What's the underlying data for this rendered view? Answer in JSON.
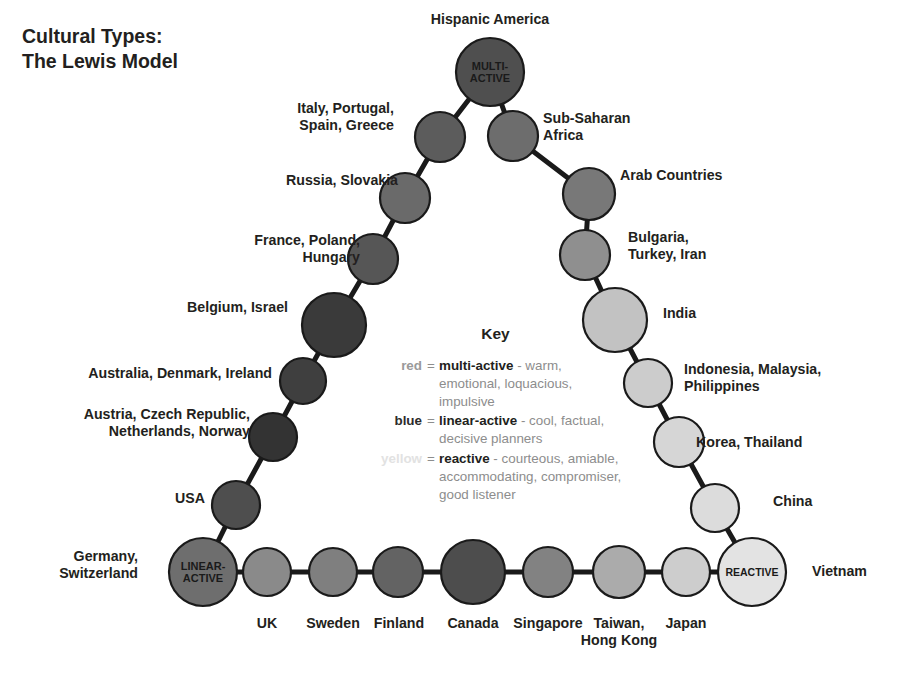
{
  "title": {
    "line1": "Cultural Types:",
    "line2": "The Lewis Model"
  },
  "key": {
    "heading": "Key",
    "rows": [
      {
        "color_word": "red",
        "color_class": "red",
        "eq": "=",
        "term": "multi-active",
        "desc": " - warm, emotional, loquacious, impulsive"
      },
      {
        "color_word": "blue",
        "color_class": "blue",
        "eq": "=",
        "term": "linear-active",
        "desc": " - cool, factual, decisive planners"
      },
      {
        "color_word": "yellow",
        "color_class": "yellow",
        "eq": "=",
        "term": "reactive",
        "desc": " - courteous, amiable, accommodating, compromiser, good listener"
      }
    ]
  },
  "apex_labels": {
    "multi_active": [
      "MULTI-",
      "ACTIVE"
    ],
    "linear_active": [
      "LINEAR-",
      "ACTIVE"
    ],
    "reactive": [
      "REACTIVE"
    ]
  },
  "chart_data": {
    "type": "diagram",
    "shape": "triangle",
    "corners": [
      "MULTI-ACTIVE",
      "LINEAR-ACTIVE",
      "REACTIVE"
    ],
    "colors": {
      "multi_active_dark": "#4a4a4a",
      "linear_active_dark": "#2e2e2e",
      "reactive_light": "#e0e0e0",
      "stroke": "#1a1a1a",
      "text": "#231f20",
      "key_muted": "#8d8d8d"
    }
  },
  "nodes": {
    "apex": {
      "name": "MULTI-ACTIVE",
      "label": "Hispanic America",
      "cx": 490,
      "cy": 72,
      "r": 34,
      "fill": "#4f4f4f"
    },
    "left_leg": [
      {
        "label": "Italy, Portugal,\nSpain, Greece",
        "cx": 440,
        "cy": 137,
        "r": 25,
        "fill": "#5c5c5c"
      },
      {
        "label": "Russia, Slovakia",
        "cx": 405,
        "cy": 198,
        "r": 25,
        "fill": "#6a6a6a"
      },
      {
        "label": "France, Poland,\nHungary",
        "cx": 373,
        "cy": 259,
        "r": 25,
        "fill": "#565656"
      },
      {
        "label": "Belgium, Israel",
        "cx": 334,
        "cy": 325,
        "r": 32,
        "fill": "#3a3a3a"
      },
      {
        "label": "Australia, Denmark, Ireland",
        "cx": 303,
        "cy": 381,
        "r": 23,
        "fill": "#3f3f3f"
      },
      {
        "label": "Austria, Czech Republic,\nNetherlands, Norway",
        "cx": 273,
        "cy": 437,
        "r": 24,
        "fill": "#333333"
      },
      {
        "label": "USA",
        "cx": 236,
        "cy": 505,
        "r": 24,
        "fill": "#4e4e4e"
      }
    ],
    "left_corner": {
      "name": "LINEAR-ACTIVE",
      "label": "Germany,\nSwitzerland",
      "cx": 203,
      "cy": 572,
      "r": 34,
      "fill": "#6e6e6e"
    },
    "bottom": [
      {
        "label": "UK",
        "cx": 267,
        "cy": 572,
        "r": 24,
        "fill": "#8a8a8a"
      },
      {
        "label": "Sweden",
        "cx": 333,
        "cy": 572,
        "r": 24,
        "fill": "#7f7f7f"
      },
      {
        "label": "Finland",
        "cx": 398,
        "cy": 572,
        "r": 25,
        "fill": "#636363"
      },
      {
        "label": "Canada",
        "cx": 473,
        "cy": 572,
        "r": 32,
        "fill": "#4d4d4d"
      },
      {
        "label": "Singapore",
        "cx": 548,
        "cy": 572,
        "r": 25,
        "fill": "#828282"
      },
      {
        "label": "Taiwan,\nHong Kong",
        "cx": 619,
        "cy": 572,
        "r": 26,
        "fill": "#ababab"
      },
      {
        "label": "Japan",
        "cx": 686,
        "cy": 572,
        "r": 24,
        "fill": "#cdcdcd"
      }
    ],
    "right_corner": {
      "name": "REACTIVE",
      "label": "Vietnam",
      "cx": 752,
      "cy": 572,
      "r": 34,
      "fill": "#e3e3e3"
    },
    "right_leg": [
      {
        "label": "Sub-Saharan\nAfrica",
        "cx": 513,
        "cy": 136,
        "r": 25,
        "fill": "#6d6d6d"
      },
      {
        "label": "Arab Countries",
        "cx": 589,
        "cy": 194,
        "r": 26,
        "fill": "#787878"
      },
      {
        "label": "Bulgaria,\nTurkey, Iran",
        "cx": 585,
        "cy": 255,
        "r": 25,
        "fill": "#8f8f8f"
      },
      {
        "label": "India",
        "cx": 615,
        "cy": 320,
        "r": 32,
        "fill": "#c2c2c2"
      },
      {
        "label": "Indonesia, Malaysia,\nPhilippines",
        "cx": 648,
        "cy": 383,
        "r": 24,
        "fill": "#cccccc"
      },
      {
        "label": "Korea, Thailand",
        "cx": 679,
        "cy": 442,
        "r": 25,
        "fill": "#d6d6d6"
      },
      {
        "label": "China",
        "cx": 715,
        "cy": 508,
        "r": 24,
        "fill": "#dcdcdc"
      }
    ]
  },
  "side_labels": {
    "hispanic_america": "Hispanic America",
    "italy": "Italy, Portugal,\nSpain, Greece",
    "russia": "Russia, Slovakia",
    "france": "France, Poland,\nHungary",
    "belgium": "Belgium, Israel",
    "australia": "Australia, Denmark, Ireland",
    "austria": "Austria, Czech Republic,\nNetherlands, Norway",
    "usa": "USA",
    "germany": "Germany,\nSwitzerland",
    "uk": "UK",
    "sweden": "Sweden",
    "finland": "Finland",
    "canada": "Canada",
    "singapore": "Singapore",
    "taiwan": "Taiwan,\nHong Kong",
    "japan": "Japan",
    "vietnam": "Vietnam",
    "subsaharan": "Sub-Saharan\nAfrica",
    "arab": "Arab Countries",
    "bulgaria": "Bulgaria,\nTurkey, Iran",
    "india": "India",
    "indonesia": "Indonesia, Malaysia,\nPhilippines",
    "korea": "Korea, Thailand",
    "china": "China"
  }
}
